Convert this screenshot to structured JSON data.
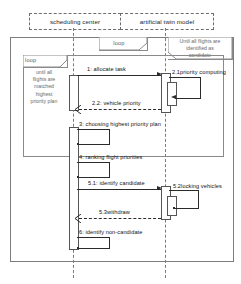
{
  "diagram": {
    "type": "uml-sequence-diagram",
    "title": "",
    "background_color": "#ffffff",
    "line_color": "#2b2b2b",
    "frame_color": "#8a8a8a"
  },
  "lifelines": [
    {
      "id": "scheduling-center",
      "label": "scheduling center"
    },
    {
      "id": "artificial-twin-model",
      "label": "artificial twin model"
    }
  ],
  "fragments": [
    {
      "id": "outer-loop",
      "operator": "loop",
      "guard": "Until all flights are identified as candidate",
      "guard_lines": [
        "Until all flights are",
        "identified as",
        "candidate"
      ]
    },
    {
      "id": "inner-loop",
      "operator": "loop",
      "guard": "until all flights are matched highest priority plan",
      "guard_lines": [
        "until all",
        "flights are",
        "matched",
        "highest",
        "priority plan"
      ]
    }
  ],
  "messages": [
    {
      "seq": "1",
      "label": "1:  allocate task",
      "kind": "call",
      "style": "solid",
      "from": "scheduling-center",
      "to": "artificial-twin-model"
    },
    {
      "seq": "2.1",
      "label": "2.1priority computing",
      "kind": "self",
      "style": "solid",
      "from": "artificial-twin-model",
      "to": "artificial-twin-model"
    },
    {
      "seq": "2.2",
      "label": "2.2:  vehicle priority",
      "kind": "return",
      "style": "dashed",
      "from": "artificial-twin-model",
      "to": "scheduling-center"
    },
    {
      "seq": "3",
      "label": "3:  choosing highest priority plan",
      "kind": "self",
      "style": "solid",
      "from": "scheduling-center",
      "to": "scheduling-center"
    },
    {
      "seq": "4",
      "label": "4:  ranking flight priorities",
      "kind": "self",
      "style": "solid",
      "from": "scheduling-center",
      "to": "scheduling-center"
    },
    {
      "seq": "5.1",
      "label": "5.1:  identify candidate",
      "kind": "call",
      "style": "solid",
      "from": "scheduling-center",
      "to": "artificial-twin-model"
    },
    {
      "seq": "5.2",
      "label": "5.2locking vehicles",
      "kind": "self",
      "style": "solid",
      "from": "artificial-twin-model",
      "to": "artificial-twin-model"
    },
    {
      "seq": "5.3",
      "label": "5.3withdraw",
      "kind": "return",
      "style": "dashed",
      "from": "artificial-twin-model",
      "to": "scheduling-center"
    },
    {
      "seq": "6",
      "label": "6:  identify non-candidate",
      "kind": "self",
      "style": "solid",
      "from": "scheduling-center",
      "to": "scheduling-center"
    }
  ]
}
